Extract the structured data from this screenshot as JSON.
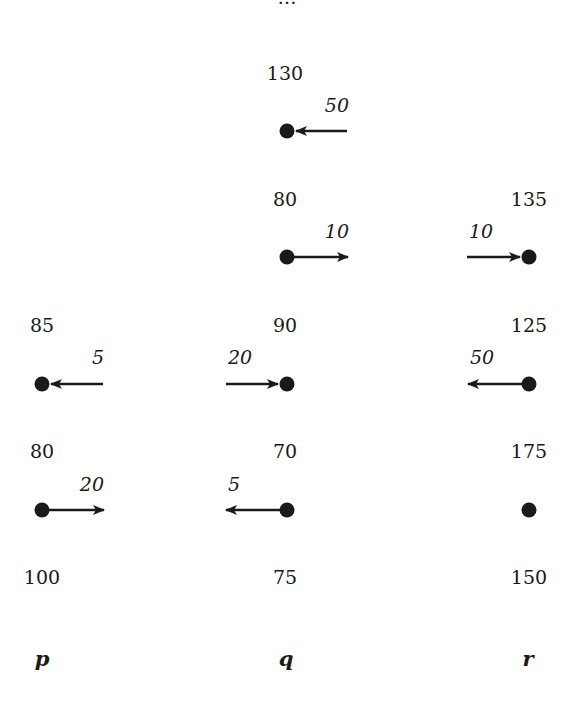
{
  "diagram": {
    "columns": [
      {
        "id": "p",
        "label": "p",
        "x": 42
      },
      {
        "id": "q",
        "label": "q",
        "x": 287
      },
      {
        "id": "r",
        "label": "r",
        "x": 529
      }
    ],
    "cut_off_top_label": "…",
    "values": {
      "q_top": "130",
      "q_row2": "80",
      "r_row2": "135",
      "p_row3": "85",
      "q_row3": "90",
      "r_row3": "125",
      "p_row4": "80",
      "q_row4": "70",
      "r_row4": "175",
      "p_bottom": "100",
      "q_bottom": "75",
      "r_bottom": "150"
    },
    "arrows": {
      "q_row1": {
        "label": "50",
        "direction": "left",
        "into_node": true
      },
      "q_row2": {
        "label": "10",
        "direction": "right",
        "into_node": false
      },
      "r_row2": {
        "label": "10",
        "direction": "right",
        "into_node": true
      },
      "p_row3": {
        "label": "5",
        "direction": "left",
        "into_node": true
      },
      "q_row3": {
        "label": "20",
        "direction": "right",
        "into_node": true
      },
      "r_row3": {
        "label": "50",
        "direction": "left",
        "into_node": false
      },
      "p_row4": {
        "label": "20",
        "direction": "right",
        "into_node": false
      },
      "q_row4": {
        "label": "5",
        "direction": "left",
        "into_node": false
      },
      "r_row4": {
        "label": "",
        "direction": "none",
        "into_node": false
      }
    },
    "axis_labels": {
      "p": "p",
      "q": "q",
      "r": "r"
    },
    "colors": {
      "ink": "#1a1a1a",
      "background": "#ffffff"
    }
  }
}
